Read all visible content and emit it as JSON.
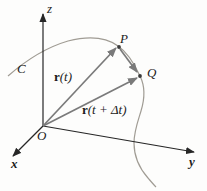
{
  "figure": {
    "colors": {
      "axis": "#262626",
      "vector": "#7a7a7a",
      "curve": "#a09c94",
      "point": "#3a3a3a"
    },
    "labels": {
      "z_axis": "z",
      "x_axis": "x",
      "y_axis": "y",
      "origin": "O",
      "curve": "C",
      "point_p": "P",
      "point_q": "Q",
      "vector_rt": {
        "bold": "r",
        "rest": "(t)"
      },
      "vector_rt_dt": {
        "bold": "r",
        "rest": "(t + Δt)"
      }
    }
  }
}
